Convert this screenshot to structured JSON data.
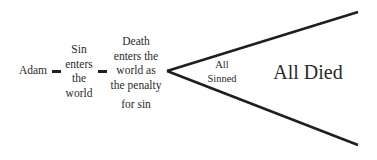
{
  "diagram": {
    "nodes": {
      "adam": "Adam",
      "sin_enters": [
        "Sin",
        "enters",
        "the",
        "world"
      ],
      "death_enters": [
        "Death",
        "enters the",
        "world as",
        "the penalty",
        "for sin"
      ],
      "all_sinned": [
        "All",
        "Sinned"
      ],
      "all_died": "All Died"
    },
    "colors": {
      "text": "#2a2a2a",
      "lines": "#1e1e1e",
      "background": "#ffffff"
    }
  }
}
